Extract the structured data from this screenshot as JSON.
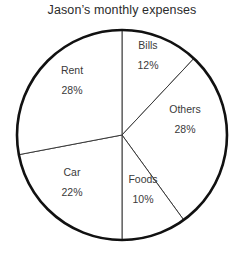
{
  "chart_data": {
    "type": "pie",
    "title": "Jason’s monthly expenses",
    "xlabel": "",
    "ylabel": "",
    "legend_position": "none",
    "grid": false,
    "units": "percent",
    "start_angle_deg": 0,
    "direction": "clockwise",
    "total": 100,
    "categories": [
      "Bills",
      "Others",
      "Foods",
      "Car",
      "Rent"
    ],
    "values": [
      12,
      28,
      10,
      22,
      28
    ],
    "value_labels": [
      "12%",
      "28%",
      "10%",
      "22%",
      "28%"
    ],
    "slices": [
      {
        "name": "Bills",
        "value": 12,
        "value_label": "12%",
        "start_deg": 0,
        "end_deg": 43.2,
        "label_x": 148,
        "label_y": 56
      },
      {
        "name": "Others",
        "value": 28,
        "value_label": "28%",
        "start_deg": 43.2,
        "end_deg": 144,
        "label_x": 185,
        "label_y": 120
      },
      {
        "name": "Foods",
        "value": 10,
        "value_label": "10%",
        "start_deg": 144,
        "end_deg": 180,
        "label_x": 143,
        "label_y": 190
      },
      {
        "name": "Car",
        "value": 22,
        "value_label": "22%",
        "start_deg": 180,
        "end_deg": 259.2,
        "label_x": 72,
        "label_y": 183
      },
      {
        "name": "Rent",
        "value": 28,
        "value_label": "28%",
        "start_deg": 259.2,
        "end_deg": 360,
        "label_x": 72,
        "label_y": 81
      }
    ],
    "geometry": {
      "center_x": 122,
      "center_y": 135,
      "radius": 105
    },
    "style": {
      "background": "#ffffff",
      "outline_color": "#111111",
      "outline_width": 2.6,
      "divider_color": "#3a3a3a",
      "divider_width": 1,
      "slice_fill": "#ffffff",
      "title_color": "#2b2b2b",
      "label_color": "#3a3a3a"
    }
  }
}
